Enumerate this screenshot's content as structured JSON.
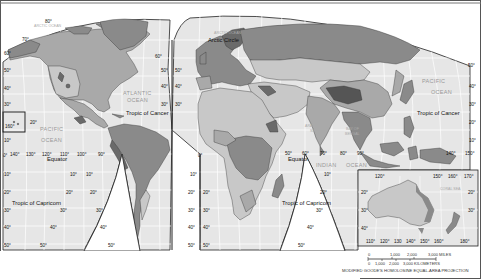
{
  "map": {
    "projection_label": "MODIFIED GOODE'S HOMOLOSINE EQUAL-AREA PROJECTION",
    "colors": {
      "ocean": "#e6e6e6",
      "graticule": "#ffffff",
      "land_light": "#c8c8c8",
      "land_mid": "#a9a9a9",
      "land_dark": "#8a8a8a",
      "land_darkest": "#6a6a6a",
      "border": "#222222",
      "background": "#ffffff"
    },
    "oceans": {
      "arctic_west": "ARCTIC OCEAN",
      "arctic_east": "ARCTIC OCEAN",
      "atlantic_1": "ATLANTIC",
      "atlantic_2": "OCEAN",
      "pacific_west_1": "PACIFIC",
      "pacific_west_2": "OCEAN",
      "pacific_east_1": "PACIFIC",
      "pacific_east_2": "OCEAN",
      "indian_1": "INDIAN",
      "indian_2": "OCEAN"
    },
    "seas": {
      "arabian_1": "ARABIAN",
      "arabian_2": "SEA",
      "bengal_1": "BAY OF",
      "bengal_2": "BENGAL",
      "coral": "CORAL SEA"
    },
    "lines": {
      "arctic_circle": "Arctic Circle",
      "tropic_cancer_atlantic": "Tropic of Cancer",
      "tropic_cancer_pacific": "Tropic of Cancer",
      "equator_west": "Equator",
      "equator_east": "Equator",
      "tropic_capricorn_west": "Tropic of Capricorn",
      "tropic_capricorn_east": "Tropic of Capricorn"
    },
    "degrees": {
      "lat_80": "80°",
      "lat_70": "70°",
      "lat_60": "60°",
      "lat_50": "50°",
      "lat_40": "40°",
      "lat_30": "30°",
      "lat_20": "20°",
      "lat_10": "10°",
      "lat_0": "0°",
      "lon_160": "160°",
      "lon_140": "140°",
      "lon_130": "130°",
      "lon_120": "120°",
      "lon_110": "110°",
      "lon_100": "100°",
      "lon_90": "90°",
      "lon_80": "80°",
      "lon_70": "70°",
      "lon_60": "60°",
      "lon_50": "50°",
      "lon_150": "150°",
      "lon_170": "170°",
      "lon_180": "180°"
    },
    "inset": {
      "lon_labels_top": [
        "120°",
        "150°",
        "160°",
        "170°"
      ],
      "lon_labels_bottom": [
        "110°",
        "120°",
        "130",
        "140°",
        "150°",
        "160°",
        "180°"
      ],
      "lat_labels": [
        "20°",
        "30°",
        "40°"
      ]
    },
    "scale_bar": {
      "miles": [
        "0",
        "1,000",
        "2,000",
        "3,000 MILES"
      ],
      "km": [
        "0",
        "1,000",
        "2,000",
        "3,000 KILOMETERS"
      ]
    }
  }
}
